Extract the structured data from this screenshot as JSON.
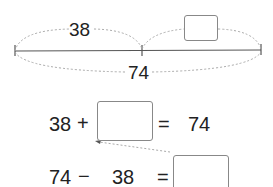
{
  "number_line": {
    "part_known": "38",
    "part_unknown": "",
    "total": "74"
  },
  "equations": {
    "addition": {
      "a": "38",
      "op": "+",
      "blank": "",
      "eq": "=",
      "result": "74"
    },
    "subtraction": {
      "a": "74",
      "op": "−",
      "b": "38",
      "eq": "=",
      "blank": ""
    }
  },
  "colors": {
    "line": "#555555",
    "dotted": "#aaaaaa",
    "box_border": "#888888"
  }
}
